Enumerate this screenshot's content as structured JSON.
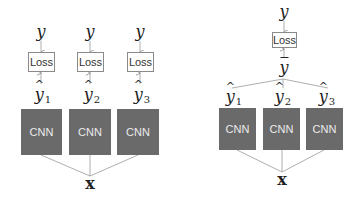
{
  "left_diagram": {
    "target_label": "y",
    "loss_label": "Loss",
    "cnn_label": "CNN",
    "prediction_base": "y",
    "prediction_subscripts": [
      "1",
      "2",
      "3"
    ],
    "input_label": "x"
  },
  "right_diagram": {
    "target_label": "y",
    "loss_label": "Loss",
    "average_label": "y",
    "cnn_label": "CNN",
    "prediction_base": "y",
    "prediction_subscripts": [
      "1",
      "2",
      "3"
    ],
    "input_label": "x"
  },
  "colors": {
    "cnn_fill": "#6a6a6a",
    "cnn_text": "#ececec",
    "loss_border": "#8a8a8a",
    "line": "#9a9a9a"
  }
}
